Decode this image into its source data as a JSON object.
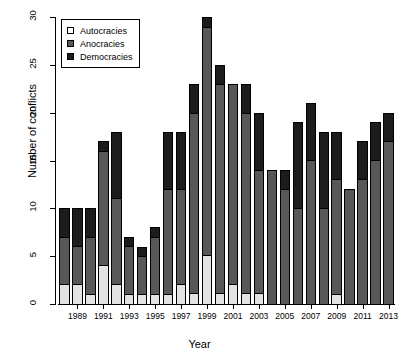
{
  "chart_data": {
    "type": "bar",
    "subtype": "stacked-bar",
    "title": "",
    "xlabel": "Year",
    "ylabel": "Number of conflicts",
    "ylim": [
      0,
      30
    ],
    "yticks": [
      0,
      5,
      10,
      15,
      20,
      25,
      30
    ],
    "ytick_labels": [
      "0",
      "5",
      "10",
      "15",
      "20",
      "25",
      "30"
    ],
    "grid": false,
    "legend_position": "top-left",
    "categories": [
      "1988",
      "1989",
      "1990",
      "1991",
      "1992",
      "1993",
      "1994",
      "1995",
      "1996",
      "1997",
      "1998",
      "1999",
      "2000",
      "2001",
      "2002",
      "2003",
      "2004",
      "2005",
      "2006",
      "2007",
      "2008",
      "2009",
      "2010",
      "2011",
      "2012",
      "2013"
    ],
    "xtick_labels": [
      "1989",
      "1991",
      "1993",
      "1995",
      "1997",
      "1999",
      "2001",
      "2003",
      "2005",
      "2007",
      "2009",
      "2011",
      "2013"
    ],
    "series": [
      {
        "name": "Autocracies",
        "color": "#e3e3e3",
        "values": [
          2,
          2,
          1,
          4,
          2,
          1,
          1,
          1,
          1,
          2,
          1,
          5,
          1,
          2,
          1,
          1,
          0,
          0,
          0,
          0,
          0,
          1,
          0,
          0,
          0,
          0
        ]
      },
      {
        "name": "Anocracies",
        "color": "#585858",
        "values": [
          5,
          4,
          6,
          12,
          9,
          5,
          4,
          6,
          11,
          10,
          19,
          24,
          22,
          21,
          19,
          13,
          14,
          12,
          10,
          15,
          10,
          12,
          12,
          13,
          15,
          17
        ]
      },
      {
        "name": "Democracies",
        "color": "#1c1c1c",
        "values": [
          3,
          4,
          3,
          1,
          7,
          1,
          1,
          1,
          6,
          6,
          3,
          1,
          2,
          0,
          3,
          6,
          0,
          2,
          9,
          6,
          8,
          5,
          0,
          4,
          4,
          3
        ]
      }
    ],
    "totals": [
      10,
      10,
      10,
      17,
      18,
      7,
      6,
      8,
      18,
      18,
      23,
      30,
      25,
      23,
      23,
      20,
      14,
      14,
      19,
      21,
      18,
      18,
      12,
      17,
      19,
      20
    ]
  },
  "legend": {
    "items": [
      {
        "label": "Autocracies",
        "swatch": "autocracies-swatch"
      },
      {
        "label": "Anocracies",
        "swatch": "anocracies-swatch"
      },
      {
        "label": "Democracies",
        "swatch": "democracies-swatch"
      }
    ]
  }
}
